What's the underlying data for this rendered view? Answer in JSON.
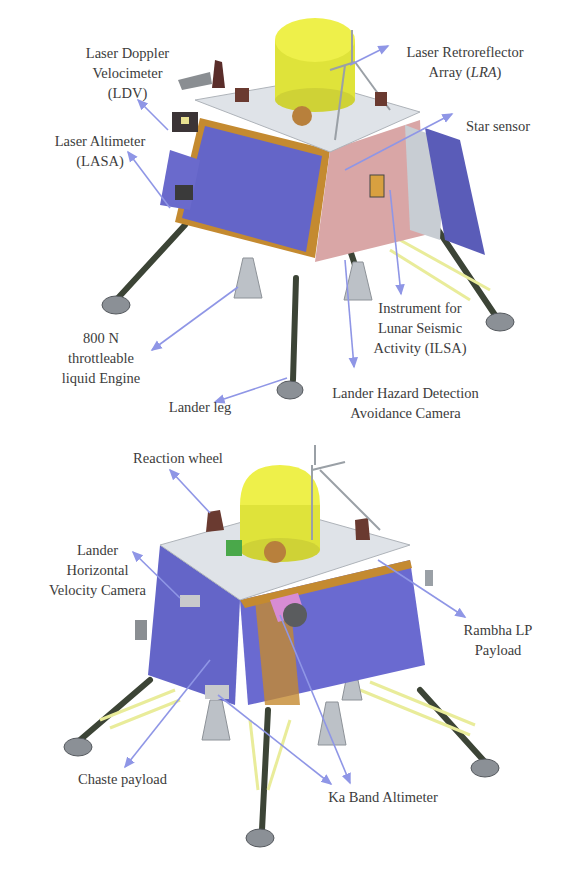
{
  "figure": {
    "panels": [
      {
        "view": "top",
        "labels": [
          {
            "id": "ldv",
            "lines": [
              "Laser Doppler",
              "Velocimeter",
              "(LDV)"
            ]
          },
          {
            "id": "lasa",
            "lines": [
              "Laser Altimeter",
              "(LASA)"
            ]
          },
          {
            "id": "lra",
            "lines": [
              "Laser Retroreflector",
              "Array (",
              "LRA",
              ")"
            ]
          },
          {
            "id": "star",
            "lines": [
              "Star sensor"
            ]
          },
          {
            "id": "engine",
            "lines": [
              "800 N",
              "throttleable",
              "liquid Engine"
            ]
          },
          {
            "id": "ilsa",
            "lines": [
              "Instrument for",
              "Lunar Seismic",
              "Activity (ILSA)"
            ]
          },
          {
            "id": "leg",
            "lines": [
              "Lander leg"
            ]
          },
          {
            "id": "lhdac",
            "lines": [
              "Lander Hazard Detection",
              "Avoidance Camera"
            ]
          }
        ]
      },
      {
        "view": "bottom",
        "labels": [
          {
            "id": "rw",
            "lines": [
              "Reaction wheel"
            ]
          },
          {
            "id": "lhvc",
            "lines": [
              "Lander",
              "Horizontal",
              "Velocity Camera"
            ]
          },
          {
            "id": "rambha",
            "lines": [
              "Rambha LP",
              "Payload"
            ]
          },
          {
            "id": "chaste",
            "lines": [
              "Chaste payload"
            ]
          },
          {
            "id": "ka",
            "lines": [
              "Ka Band Altimeter"
            ]
          }
        ]
      }
    ],
    "colors": {
      "arrow": "#8f96e6",
      "solar_panel": "#6465c8",
      "deck": "#dfe3e8",
      "dome": "#e6ea3c",
      "frame": "#c48a30",
      "side_pink": "#d9a6a6",
      "leg": "#3c4436",
      "nozzle": "#bcc1c7",
      "text": "#3c3c3c"
    }
  }
}
